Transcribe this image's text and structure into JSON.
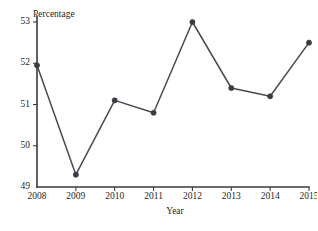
{
  "chart_data": {
    "type": "line",
    "title": "",
    "xlabel": "Year",
    "ylabel": "Percentage",
    "categories": [
      "2008",
      "2009",
      "2010",
      "2011",
      "2012",
      "2013",
      "2014",
      "2015"
    ],
    "x": [
      2008,
      2009,
      2010,
      2011,
      2012,
      2013,
      2014,
      2015
    ],
    "values": [
      51.95,
      49.3,
      51.1,
      50.8,
      53.0,
      51.4,
      51.2,
      52.5
    ],
    "series": [
      {
        "name": "Percentage",
        "values": [
          51.95,
          49.3,
          51.1,
          50.8,
          53.0,
          51.4,
          51.2,
          52.5
        ]
      }
    ],
    "ylim": [
      49,
      53
    ],
    "xlim": [
      2008,
      2015
    ],
    "ytick_labels": [
      "49",
      "50",
      "51",
      "52",
      "53"
    ],
    "ytick_values": [
      49,
      50,
      51,
      52,
      53
    ],
    "xtick_labels": [
      "2008",
      "2009",
      "2010",
      "2011",
      "2012",
      "2013",
      "2014",
      "2015"
    ],
    "grid": false,
    "legend": "none",
    "marker": "circle",
    "line_color": "#4a4a52",
    "marker_color": "#3b3b42",
    "axis_color": "#3a3a3a",
    "background_color": "#ffffff"
  },
  "axes": {
    "y_title": "Percentage",
    "x_title": "Year"
  }
}
